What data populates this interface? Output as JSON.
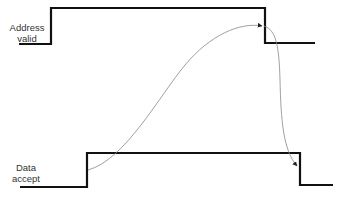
{
  "diagram": {
    "type": "timing-diagram",
    "signals": [
      {
        "name": "address-valid",
        "label_line1": "Address",
        "label_line2": "valid",
        "waveform": [
          [
            19,
            44
          ],
          [
            51,
            44
          ],
          [
            51,
            8
          ],
          [
            265,
            8
          ],
          [
            265,
            43
          ],
          [
            315,
            43
          ]
        ]
      },
      {
        "name": "data-accept",
        "label_line1": "Data",
        "label_line2": "accept",
        "waveform": [
          [
            20,
            187
          ],
          [
            87,
            187
          ],
          [
            87,
            153
          ],
          [
            300,
            153
          ],
          [
            300,
            185
          ],
          [
            333,
            185
          ]
        ]
      }
    ],
    "causal_arrows": [
      {
        "from": "data-accept rising edge",
        "to": "address-valid falling edge"
      },
      {
        "from": "address-valid falling edge",
        "to": "data-accept falling edge"
      }
    ],
    "colors": {
      "signal": "#111111",
      "arrow": "#777777",
      "label": "#333333"
    }
  }
}
